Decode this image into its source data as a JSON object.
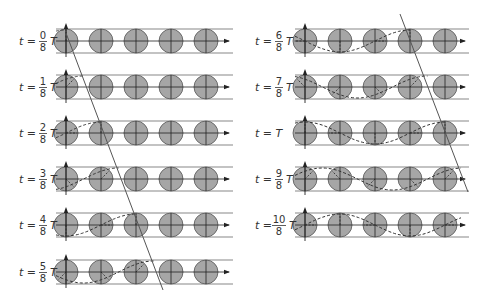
{
  "figure": {
    "colors": {
      "circle_fill": "#a6a6a6",
      "circle_stroke": "#555555",
      "guide_line": "#888888",
      "axis": "#222222",
      "wave": "#333333",
      "front_line": "#555555"
    },
    "circles_per_row": 5,
    "wavelength_in_circles": 4,
    "left_column": {
      "x0": 66,
      "spacing": 35,
      "line_start": 56,
      "line_end": 233,
      "rows": [
        {
          "label_pre": "t =",
          "num": "0",
          "den": "8",
          "label_post": "T",
          "t": 0,
          "y": 41
        },
        {
          "label_pre": "t =",
          "num": "1",
          "den": "8",
          "label_post": "T",
          "t": 0.125,
          "y": 87
        },
        {
          "label_pre": "t =",
          "num": "2",
          "den": "8",
          "label_post": "T",
          "t": 0.25,
          "y": 133
        },
        {
          "label_pre": "t =",
          "num": "3",
          "den": "8",
          "label_post": "T",
          "t": 0.375,
          "y": 179
        },
        {
          "label_pre": "t =",
          "num": "4",
          "den": "8",
          "label_post": "T",
          "t": 0.5,
          "y": 225
        },
        {
          "label_pre": "t =",
          "num": "5",
          "den": "8",
          "label_post": "T",
          "t": 0.625,
          "y": 272
        }
      ],
      "front_line": {
        "x1": 66,
        "y1": 33,
        "x2": 163,
        "y2": 290
      }
    },
    "right_column": {
      "x0": 305,
      "spacing": 35,
      "line_start": 295,
      "line_end": 469,
      "rows": [
        {
          "label_pre": "t =",
          "num": "6",
          "den": "8",
          "label_post": "T",
          "t": 0.75,
          "y": 41
        },
        {
          "label_pre": "t =",
          "num": "7",
          "den": "8",
          "label_post": "T",
          "t": 0.875,
          "y": 87
        },
        {
          "label_pre": "t = T",
          "num": "",
          "den": "",
          "label_post": "",
          "t": 1.0,
          "y": 133
        },
        {
          "label_pre": "t =",
          "num": "9",
          "den": "8",
          "label_post": "T",
          "t": 1.125,
          "y": 179
        },
        {
          "label_pre": "t =",
          "num": "10",
          "den": "8",
          "label_post": "T",
          "t": 1.25,
          "y": 225
        }
      ],
      "front_line": {
        "x1": 400,
        "y1": 14,
        "x2": 468,
        "y2": 192
      }
    }
  }
}
